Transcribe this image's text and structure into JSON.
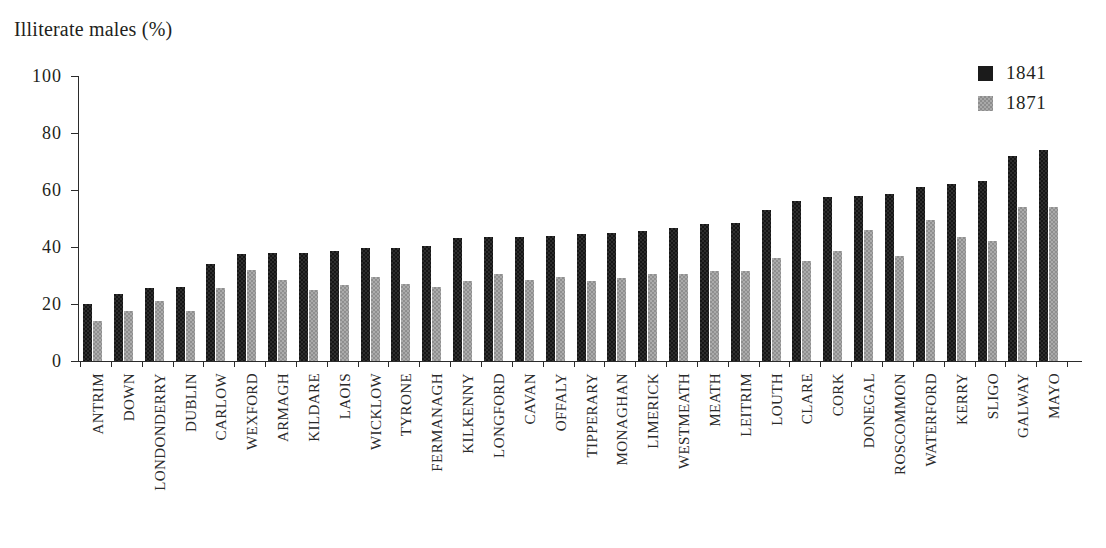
{
  "chart_data": {
    "type": "bar",
    "title": "Illiterate males (%)",
    "xlabel": "",
    "ylabel": "Illiterate males (%)",
    "ylim": [
      0,
      100
    ],
    "yticks": [
      0,
      20,
      40,
      60,
      80,
      100
    ],
    "ytick_labels": [
      "0",
      "20",
      "40",
      "60",
      "80",
      "100"
    ],
    "grid": false,
    "legend_position": "top-right",
    "orientation": "vertical",
    "grouping": "grouped",
    "categories": [
      "ANTRIM",
      "DOWN",
      "LONDONDERRY",
      "DUBLIN",
      "CARLOW",
      "WEXFORD",
      "ARMAGH",
      "KILDARE",
      "LAOIS",
      "WICKLOW",
      "TYRONE",
      "FERMANAGH",
      "KILKENNY",
      "LONGFORD",
      "CAVAN",
      "OFFALY",
      "TIPPERARY",
      "MONAGHAN",
      "LIMERICK",
      "WESTMEATH",
      "MEATH",
      "LEITRIM",
      "LOUTH",
      "CLARE",
      "CORK",
      "DONEGAL",
      "ROSCOMMON",
      "WATERFORD",
      "KERRY",
      "SLIGO",
      "GALWAY",
      "MAYO"
    ],
    "series": [
      {
        "name": "1841",
        "color": "#161616",
        "values": [
          20,
          23.5,
          25.5,
          26,
          34,
          37.5,
          38,
          38,
          38.5,
          39.5,
          39.5,
          40.5,
          43,
          43.5,
          43.5,
          44,
          44.5,
          45,
          45.5,
          46.5,
          48,
          48.5,
          53,
          56,
          57.5,
          58,
          58.5,
          61,
          62,
          63,
          72,
          74
        ]
      },
      {
        "name": "1871",
        "color": "#ababab",
        "values": [
          14,
          17.5,
          21,
          17.5,
          25.5,
          32,
          28.5,
          25,
          26.5,
          29.5,
          27,
          26,
          28,
          30.5,
          28.5,
          29.5,
          28,
          29,
          30.5,
          30.5,
          31.5,
          31.5,
          36,
          35,
          38.5,
          46,
          37,
          49.5,
          43.5,
          42,
          54,
          54
        ]
      }
    ]
  },
  "legend": {
    "entries": [
      {
        "label": "1841",
        "swatch_class": "s1841",
        "swatch_name": "legend-swatch-1841"
      },
      {
        "label": "1871",
        "swatch_class": "s1871",
        "swatch_name": "legend-swatch-1871"
      }
    ]
  }
}
